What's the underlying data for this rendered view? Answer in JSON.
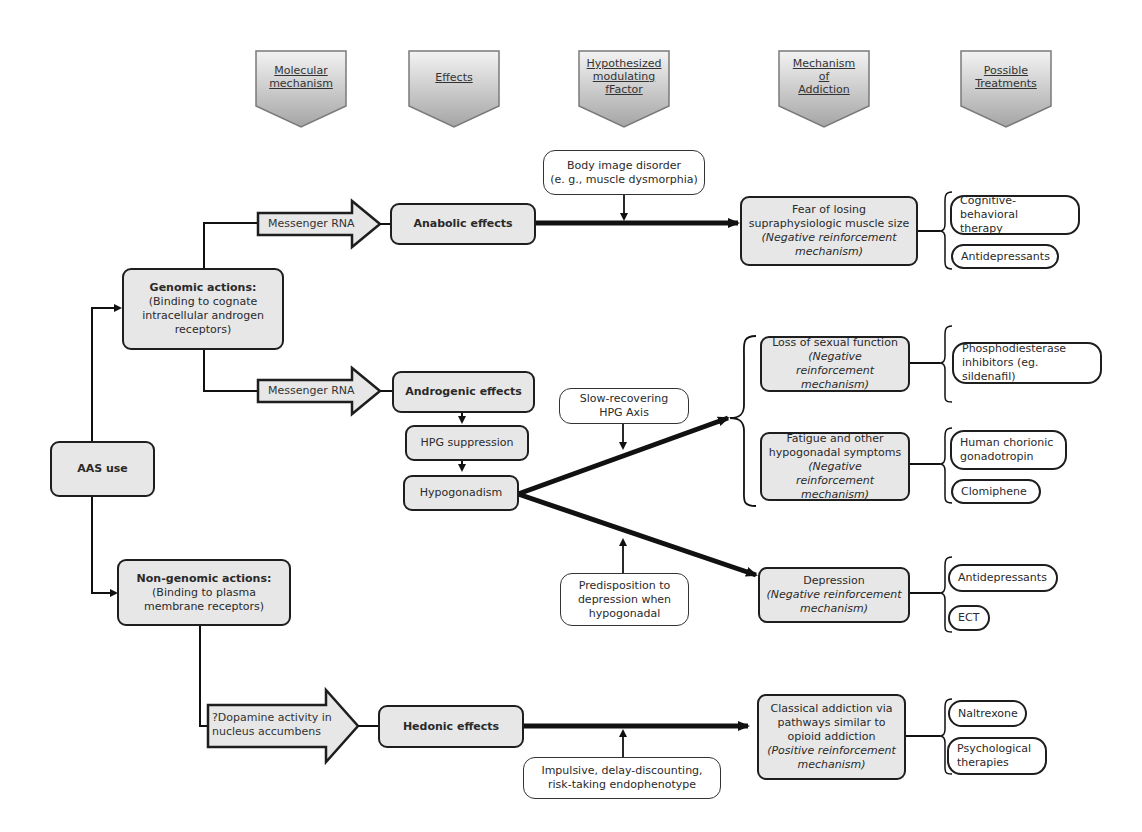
{
  "headers": [
    {
      "id": "molecular",
      "label": "Molecular mechanism",
      "lines": [
        "Molecular",
        "mechanism"
      ]
    },
    {
      "id": "effects",
      "label": "Effects",
      "lines": [
        "Effects"
      ]
    },
    {
      "id": "factor",
      "label": "Hypothesized modulating fFactor",
      "lines": [
        "Hypothesized",
        "modulating",
        "fFactor"
      ]
    },
    {
      "id": "addiction",
      "label": "Mechanism of Addiction",
      "lines": [
        "Mechanism",
        "of",
        "Addiction"
      ]
    },
    {
      "id": "treatments",
      "label": "Possible Treatments",
      "lines": [
        "Possible",
        "Treatments"
      ]
    }
  ],
  "root": {
    "label": "AAS use"
  },
  "mechanisms": {
    "genomic": {
      "title": "Genomic actions:",
      "lines": [
        "(Binding to cognate",
        "intracellular androgen",
        "receptors)"
      ]
    },
    "nongenomic": {
      "title": "Non-genomic actions:",
      "lines": [
        "(Binding to plasma",
        "membrane receptors)"
      ]
    }
  },
  "arrows": {
    "mrna1": "Messenger RNA",
    "mrna2": "Messenger RNA",
    "dopamine": [
      "?Dopamine activity in",
      "nucleus accumbens"
    ]
  },
  "effects": {
    "anabolic": "Anabolic effects",
    "androgenic": "Androgenic effects",
    "hpg": "HPG suppression",
    "hypogonadism": "Hypogonadism",
    "hedonic": "Hedonic effects"
  },
  "factors": {
    "body_image": [
      "Body image disorder",
      "(e. g., muscle dysmorphia)"
    ],
    "slow_hpg": [
      "Slow-recovering",
      "HPG Axis"
    ],
    "predisposition": [
      "Predisposition to",
      "depression when",
      "hypogonadal"
    ],
    "impulsive": [
      "Impulsive, delay-discounting,",
      "risk-taking endophenotype"
    ]
  },
  "addiction": {
    "fear": {
      "lines": [
        "Fear of losing",
        "supraphysiologic muscle size"
      ],
      "mechanism": [
        "(Negative reinforcement",
        "mechanism)"
      ]
    },
    "sexual": {
      "lines": [
        "Loss of sexual function"
      ],
      "mechanism": [
        "(Negative reinforcement",
        "mechanism)"
      ]
    },
    "fatigue": {
      "lines": [
        "Fatigue and other",
        "hypogonadal symptoms"
      ],
      "mechanism": [
        "(Negative reinforcement",
        "mechanism)"
      ]
    },
    "depression": {
      "lines": [
        "Depression"
      ],
      "mechanism": [
        "(Negative reinforcement",
        "mechanism)"
      ]
    },
    "classical": {
      "lines": [
        "Classical addiction via",
        "pathways similar to",
        "opioid addiction"
      ],
      "mechanism": [
        "(Positive reinforcement",
        "mechanism)"
      ]
    }
  },
  "treatments": {
    "cbt": [
      "Cognitive-behavioral",
      "therapy"
    ],
    "antidep1": [
      "Antidepressants"
    ],
    "pde": [
      "Phosphodiesterase",
      "inhibitors (eg. sildenafil)"
    ],
    "hcg": [
      "Human chorionic",
      "gonadotropin"
    ],
    "clomiphene": [
      "Clomiphene"
    ],
    "antidep2": [
      "Antidepressants"
    ],
    "ect": [
      "ECT"
    ],
    "naltrexone": [
      "Naltrexone"
    ],
    "psych": [
      "Psychological",
      "therapies"
    ]
  },
  "colors": {
    "box_fill": "#e7e7e7",
    "stroke": "#1e1e1e",
    "header_top": "#f2f2f2",
    "header_bottom": "#a8a8a8"
  }
}
